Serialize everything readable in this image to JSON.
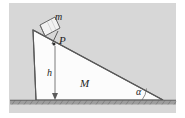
{
  "figure": {
    "type": "physics-diagram",
    "background_color": "#d9d9d9",
    "page_color": "#ffffff",
    "wedge_fill": "#fbfbfb",
    "line_color": "#4a4a4a",
    "ground_color": "#9a9a9a",
    "labels": {
      "block_mass": "m",
      "point": "P",
      "height": "h",
      "wedge_mass": "M",
      "angle": "α"
    },
    "geometry": {
      "apex": [
        33,
        30
      ],
      "bottom_left": [
        36,
        100
      ],
      "bottom_right": [
        163,
        100
      ],
      "point_p": [
        54,
        44
      ],
      "height_line_x": 56,
      "height_top_y": 46,
      "height_bottom_y": 100,
      "ground_y": 101,
      "ground_x_start": 10,
      "ground_x_end": 176
    }
  }
}
